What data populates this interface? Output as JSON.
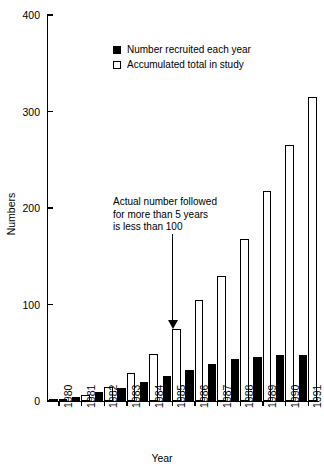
{
  "chart_data": {
    "type": "bar",
    "title": "",
    "xlabel": "Year",
    "ylabel": "Numbers",
    "ylim": [
      0,
      400
    ],
    "yticks": [
      0,
      100,
      200,
      300,
      400
    ],
    "grid": false,
    "legend_position": "top-center",
    "categories": [
      "1980",
      "1981",
      "1982",
      "1983",
      "1984",
      "1985",
      "1986",
      "1987",
      "1988",
      "1989",
      "1990",
      "1991"
    ],
    "series": [
      {
        "name": "Number recruited each year",
        "style": "filled-black",
        "values": [
          2,
          4,
          9,
          14,
          20,
          26,
          32,
          38,
          44,
          46,
          48,
          48
        ]
      },
      {
        "name": "Accumulated total in study",
        "style": "open-white",
        "values": [
          2,
          6,
          15,
          29,
          49,
          75,
          105,
          130,
          168,
          218,
          265,
          315
        ]
      }
    ],
    "annotations": [
      {
        "text": "Actual number followed\nfor more than 5 years\nis less than 100",
        "arrow": true,
        "points_to_category": "1985",
        "points_to_series": "Accumulated total in study"
      }
    ]
  },
  "legend": {
    "items": [
      {
        "label": "Number recruited each year",
        "swatch": "filled-square"
      },
      {
        "label": "Accumulated total in study",
        "swatch": "open-square"
      }
    ]
  },
  "axes": {
    "y_title": "Numbers",
    "x_title": "Year",
    "y_tick_labels": [
      "400",
      "300",
      "200",
      "100",
      "0"
    ]
  },
  "colors": {
    "foreground": "#000000",
    "background": "#ffffff",
    "recruited_fill": "#000000",
    "accumulated_fill": "#ffffff"
  }
}
